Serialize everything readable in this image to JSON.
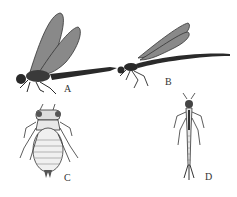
{
  "figure": {
    "labels": {
      "a": "A",
      "b": "B",
      "c": "C",
      "d": "D"
    },
    "subjects": {
      "a": "dragonfly adult (perched, wings raised)",
      "b": "damselfly adult (slender, wings folded)",
      "c": "dragonfly nymph (dorsal view)",
      "d": "damselfly nymph (dorsal view, caudal gills)"
    },
    "colors": {
      "ink": "#2a2a2a",
      "wing": "#6a6a6a",
      "background": "#ffffff"
    }
  }
}
